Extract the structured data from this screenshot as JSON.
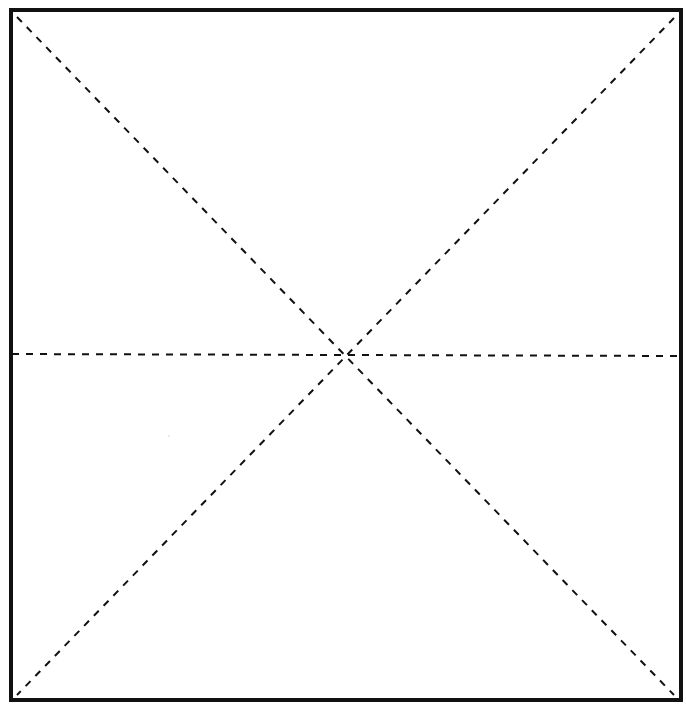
{
  "diagram": {
    "type": "square-division-template",
    "canvas": {
      "width": 686,
      "height": 712,
      "background": "#ffffff"
    },
    "border": {
      "x1": 11,
      "y1": 10,
      "x2": 681,
      "y2": 700,
      "stroke": "#111111",
      "stroke_width": 4
    },
    "dashed_lines": [
      {
        "name": "diagonal-top-left-to-bottom-right",
        "x1": 17,
        "y1": 17,
        "x2": 674,
        "y2": 695
      },
      {
        "name": "diagonal-top-right-to-bottom-left",
        "x1": 674,
        "y1": 18,
        "x2": 17,
        "y2": 695
      },
      {
        "name": "horizontal-midline",
        "x1": 12,
        "y1": 354,
        "x2": 680,
        "y2": 356
      }
    ],
    "dash": {
      "stroke": "#111111",
      "stroke_width": 2,
      "pattern": "7 7"
    },
    "center_point": {
      "x": 343,
      "y": 354
    },
    "labels": []
  }
}
